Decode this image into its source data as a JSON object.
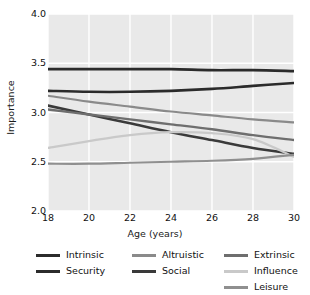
{
  "chart_data": {
    "type": "line",
    "title": "",
    "xlabel": "Age (years)",
    "ylabel": "Importance",
    "xlim": [
      18,
      30
    ],
    "ylim": [
      2.0,
      4.0
    ],
    "xticks": [
      18,
      20,
      22,
      24,
      26,
      28,
      30
    ],
    "xticklabels": [
      "18",
      "20",
      "22",
      "24",
      "26",
      "28",
      "30"
    ],
    "yticks": [
      2.0,
      2.5,
      3.0,
      3.5,
      4.0
    ],
    "yticklabels": [
      "2.0",
      "2.5",
      "3.0",
      "3.5",
      "4.0"
    ],
    "grid": true,
    "grid_color": "#ffffff",
    "plot_background": "#e9e9e9",
    "legend_position": "below",
    "legend_columns": 3,
    "x": [
      18,
      20,
      22,
      24,
      26,
      28,
      30
    ],
    "series": [
      {
        "name": "Intrinsic",
        "color": "#2b2b2b",
        "width": 2.6,
        "values": [
          3.44,
          3.44,
          3.44,
          3.44,
          3.43,
          3.43,
          3.42
        ]
      },
      {
        "name": "Security",
        "color": "#2b2b2b",
        "width": 2.6,
        "values": [
          3.22,
          3.21,
          3.21,
          3.22,
          3.24,
          3.27,
          3.3
        ]
      },
      {
        "name": "Altruistic",
        "color": "#8a8a8a",
        "width": 2.2,
        "values": [
          3.17,
          3.11,
          3.06,
          3.01,
          2.97,
          2.93,
          2.9
        ]
      },
      {
        "name": "Social",
        "color": "#3a3a3a",
        "width": 2.6,
        "values": [
          3.07,
          2.98,
          2.89,
          2.8,
          2.72,
          2.64,
          2.58
        ]
      },
      {
        "name": "Extrinsic",
        "color": "#6e6e6e",
        "width": 2.4,
        "values": [
          3.03,
          2.98,
          2.93,
          2.88,
          2.83,
          2.77,
          2.72
        ]
      },
      {
        "name": "Influence",
        "color": "#c9c9c9",
        "width": 2.2,
        "values": [
          2.64,
          2.71,
          2.77,
          2.8,
          2.79,
          2.73,
          2.55
        ]
      },
      {
        "name": "Leisure",
        "color": "#8f8f8f",
        "width": 2.2,
        "values": [
          2.48,
          2.48,
          2.49,
          2.5,
          2.51,
          2.53,
          2.57
        ]
      }
    ],
    "legend": [
      {
        "label": "Intrinsic",
        "color": "#2b2b2b"
      },
      {
        "label": "Altruistic",
        "color": "#8a8a8a"
      },
      {
        "label": "Extrinsic",
        "color": "#6e6e6e"
      },
      {
        "label": "Security",
        "color": "#2b2b2b"
      },
      {
        "label": "Social",
        "color": "#3a3a3a"
      },
      {
        "label": "Influence",
        "color": "#c9c9c9"
      },
      {
        "label": "Leisure",
        "color": "#8f8f8f"
      }
    ]
  }
}
